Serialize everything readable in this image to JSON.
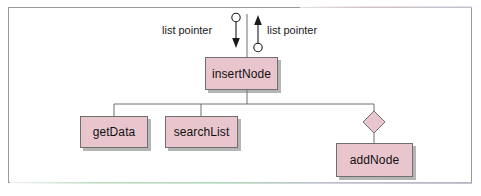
{
  "diagram": {
    "type": "structure-chart",
    "colors": {
      "node_fill": "#e9c6ce",
      "node_stroke": "#6f6f6f",
      "connector": "#6f6f6f",
      "frame": "#9a9a9a",
      "text": "#111111",
      "shadow": "#787878"
    },
    "frame": {
      "x": 8,
      "y": 7,
      "width": 464,
      "height": 176
    },
    "nodes": [
      {
        "id": "insertNode",
        "label": "insertNode",
        "x": 205,
        "y": 57,
        "width": 73,
        "height": 33
      },
      {
        "id": "getData",
        "label": "getData",
        "x": 80,
        "y": 116,
        "width": 68,
        "height": 32
      },
      {
        "id": "searchList",
        "label": "searchList",
        "x": 165,
        "y": 116,
        "width": 73,
        "height": 32
      },
      {
        "id": "addNode",
        "label": "addNode",
        "x": 336,
        "y": 143,
        "width": 77,
        "height": 34
      }
    ],
    "annotations": [
      {
        "id": "data-couple-in",
        "label": "list pointer",
        "x": 162,
        "y": 24,
        "align": "left"
      },
      {
        "id": "data-couple-out",
        "label": "list pointer",
        "x": 267,
        "y": 24,
        "align": "left"
      }
    ],
    "couples": [
      {
        "id": "couple-down",
        "name": "list pointer",
        "direction": "down",
        "symbol": "open-circle-arrow",
        "cx": 236,
        "top": 14,
        "bottom": 48
      },
      {
        "id": "couple-up",
        "name": "list pointer",
        "direction": "up",
        "symbol": "open-circle-arrow",
        "cx": 258,
        "top": 16,
        "bottom": 50
      }
    ],
    "decision_symbol": {
      "id": "selection-diamond",
      "shape": "diamond",
      "cx": 374,
      "cy": 122,
      "half": 11
    },
    "connectors": {
      "trunk_top_x": 247,
      "bus_y": 104,
      "bus_left": 114,
      "bus_right": 374,
      "branch_xs": [
        114,
        201,
        374
      ]
    }
  }
}
